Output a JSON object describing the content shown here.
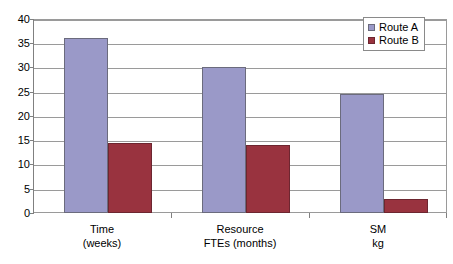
{
  "chart_data": {
    "type": "bar",
    "title": "",
    "xlabel": "",
    "ylabel": "",
    "ylim": [
      0,
      40
    ],
    "yticks": [
      0,
      5,
      10,
      15,
      20,
      25,
      30,
      35,
      40
    ],
    "grid": true,
    "legend_position": "top-right",
    "categories": [
      "Time\n(weeks)",
      "Resource\nFTEs (months)",
      "SM\nkg"
    ],
    "category_lines": [
      [
        "Time",
        "(weeks)"
      ],
      [
        "Resource",
        "FTEs (months)"
      ],
      [
        "SM",
        "kg"
      ]
    ],
    "series": [
      {
        "name": "Route A",
        "color": "#9a99c8",
        "values": [
          36.0,
          30.0,
          24.5
        ]
      },
      {
        "name": "Route B",
        "color": "#99333f",
        "values": [
          14.5,
          14.0,
          2.9
        ]
      }
    ]
  },
  "legend": {
    "items": [
      {
        "label": "Route A"
      },
      {
        "label": "Route B"
      }
    ]
  },
  "axis": {
    "y_tick_labels": [
      "0",
      "5",
      "10",
      "15",
      "20",
      "25",
      "30",
      "35",
      "40"
    ]
  }
}
